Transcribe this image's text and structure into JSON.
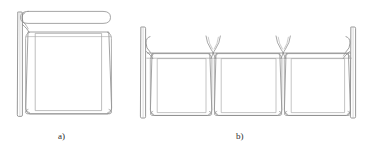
{
  "figure": {
    "type": "technical-line-drawing",
    "background_color": "#ffffff",
    "stroke_color": "#8c8c8c",
    "stroke_color_dark": "#6e6e6e",
    "label_color": "#2b2b2b",
    "canvas": {
      "width": 371,
      "height": 156
    },
    "captions": [
      {
        "id": "label-a",
        "text": "a)",
        "x": 58,
        "y": 131
      },
      {
        "id": "label-b",
        "text": "b)",
        "x": 236,
        "y": 131
      }
    ],
    "panels_a": {
      "count": 1,
      "description": "single panel with stadium-shaped top rail, hooked end, wall post at left"
    },
    "panels_b": {
      "count": 3,
      "description": "three panels in a row joined by Y-shaped hinge connectors, wall posts at both ends"
    },
    "connectors": {
      "y_connector_count": 2,
      "hook_count": 3
    }
  }
}
